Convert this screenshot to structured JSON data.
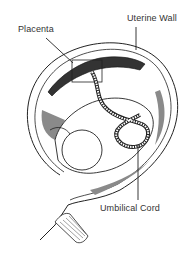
{
  "diagram": {
    "labels": {
      "placenta": "Placenta",
      "uterine_wall": "Uterine Wall",
      "umbilical_cord": "Umbilical Cord"
    },
    "colors": {
      "line": "#222222",
      "shade": "#8a8a8a",
      "background": "#ffffff"
    }
  }
}
